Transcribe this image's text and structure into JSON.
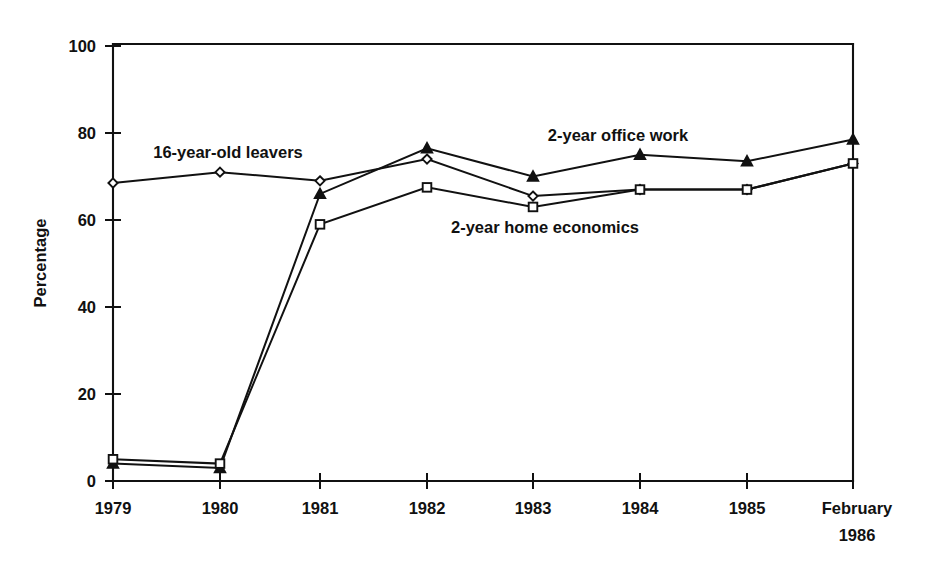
{
  "chart_data": {
    "type": "line",
    "title": "",
    "subtitle": "",
    "xlabel": "",
    "ylabel": "Percentage",
    "ylim": [
      0,
      100
    ],
    "grid": false,
    "legend_position": "inline-annotations",
    "categories": [
      "1979",
      "1980",
      "1981",
      "1982",
      "1983",
      "1984",
      "1985",
      "February 1986"
    ],
    "x_tick_labels": [
      {
        "line1": "1979",
        "line2": ""
      },
      {
        "line1": "1980",
        "line2": ""
      },
      {
        "line1": "1981",
        "line2": ""
      },
      {
        "line1": "1982",
        "line2": ""
      },
      {
        "line1": "1983",
        "line2": ""
      },
      {
        "line1": "1984",
        "line2": ""
      },
      {
        "line1": "1985",
        "line2": ""
      },
      {
        "line1": "February",
        "line2": "1986"
      }
    ],
    "y_tick_labels": [
      "0",
      "20",
      "40",
      "60",
      "80",
      "100"
    ],
    "y_ticks": [
      0,
      20,
      40,
      60,
      80,
      100
    ],
    "series": [
      {
        "name": "16-year-old leavers",
        "marker": "diamond-open",
        "values": [
          68.5,
          71.0,
          69.0,
          74.0,
          65.5,
          67.0,
          67.0,
          73.0
        ]
      },
      {
        "name": "2-year office work",
        "marker": "triangle-solid",
        "values": [
          4.0,
          3.0,
          66.0,
          76.5,
          70.0,
          75.0,
          73.5,
          78.5
        ]
      },
      {
        "name": "2-year home economics",
        "marker": "square-open",
        "values": [
          5.0,
          4.0,
          59.0,
          67.5,
          63.0,
          67.0,
          67.0,
          73.0
        ]
      }
    ],
    "annotations": [
      {
        "text": "16-year-old leavers",
        "series": "16-year-old leavers",
        "x": 228,
        "y": 152
      },
      {
        "text": "2-year office work",
        "series": "2-year office work",
        "x": 618,
        "y": 135
      },
      {
        "text": "2-year home economics",
        "series": "2-year home economics",
        "x": 545,
        "y": 227
      }
    ]
  },
  "axes": {
    "y_axis_title": "Percentage"
  }
}
